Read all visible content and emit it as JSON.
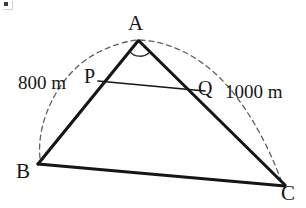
{
  "figure": {
    "type": "geometry-diagram",
    "shape": "triangle",
    "background_color": "#ffffff",
    "stroke_color": "#16161a",
    "dash_color": "#5a5a5a"
  },
  "vertices": {
    "A": {
      "label": "A",
      "x": 138,
      "y": 40
    },
    "B": {
      "label": "B",
      "x": 38,
      "y": 164
    },
    "C": {
      "label": "C",
      "x": 285,
      "y": 186
    }
  },
  "points": {
    "P": {
      "label": "P",
      "x": 98,
      "y": 81,
      "on_segment": "AB"
    },
    "Q": {
      "label": "Q",
      "x": 205,
      "y": 91,
      "on_segment": "AC"
    }
  },
  "measurements": [
    {
      "label": "800 m",
      "value": 800,
      "unit": "m",
      "side": "AB"
    },
    {
      "label": "1000 m",
      "value": 1000,
      "unit": "m",
      "side": "AC"
    }
  ],
  "segments": [
    {
      "name": "AB",
      "from": "A",
      "to": "B",
      "style": "solid"
    },
    {
      "name": "AC",
      "from": "A",
      "to": "C",
      "style": "solid"
    },
    {
      "name": "BC",
      "from": "B",
      "to": "C",
      "style": "solid"
    },
    {
      "name": "PQ",
      "from": "P",
      "to": "Q",
      "style": "solid"
    }
  ],
  "arcs": [
    {
      "name": "arc-AB",
      "from": "B",
      "to": "A",
      "style": "dashed",
      "measure_label": "800 m"
    },
    {
      "name": "arc-AC",
      "from": "A",
      "to": "C",
      "style": "dashed",
      "measure_label": "1000 m"
    },
    {
      "name": "angle-mark-A",
      "at": "A",
      "style": "solid"
    }
  ]
}
